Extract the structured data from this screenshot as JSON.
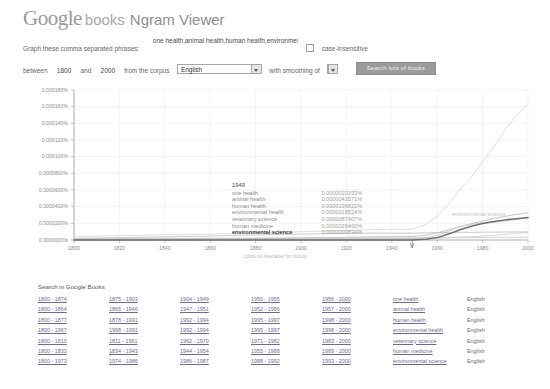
{
  "header": {
    "logo_google": "Google",
    "logo_books": "books",
    "logo_title": "Ngram Viewer"
  },
  "query": {
    "phrases_label": "Graph these comma separated phrases:",
    "phrases_value": "one health,animal health,human health,environmental health,veterina",
    "case_insensitive_label": "case-insensitive",
    "case_insensitive_checked": false,
    "between_label": "between",
    "year_start": "1800",
    "and_label": "and",
    "year_end": "2000",
    "corpus_label": "from the corpus",
    "corpus_value": "English",
    "smoothing_label": "with smoothing of",
    "smoothing_value": "3",
    "search_button": "Search lots of books"
  },
  "chart_data": {
    "type": "line",
    "title": "",
    "xlabel": "",
    "ylabel": "",
    "xlim": [
      1800,
      2000
    ],
    "ylim": [
      0,
      0.00019
    ],
    "grid": true,
    "legend": "on-plot",
    "caption": "(click on line/label for focus)",
    "x_ticks": [
      "1800",
      "1820",
      "1840",
      "1860",
      "1880",
      "1900",
      "1920",
      "1940",
      "1960",
      "1980",
      "2000"
    ],
    "y_ticks": [
      "0.000180%",
      "0.000160%",
      "0.000140%",
      "0.000120%",
      "0.000100%",
      "0.0000800%",
      "0.0000600%",
      "0.0000400%",
      "0.0000200%",
      "0.0000000%"
    ],
    "x": [
      1800,
      1820,
      1840,
      1860,
      1880,
      1900,
      1920,
      1930,
      1940,
      1949,
      1955,
      1960,
      1965,
      1970,
      1975,
      1980,
      1985,
      1990,
      1995,
      2000
    ],
    "series": [
      {
        "name": "one health",
        "color": "#cfcfcf",
        "values": [
          1e-06,
          1.2e-06,
          1.4e-06,
          1.6e-06,
          1.8e-06,
          1.9e-06,
          2e-06,
          2e-06,
          2e-06,
          2e-06,
          2.2e-06,
          2.5e-06,
          3e-06,
          3.6e-06,
          4.2e-06,
          5e-06,
          6e-06,
          7.2e-06,
          8.5e-06,
          9.5e-06
        ]
      },
      {
        "name": "animal health",
        "color": "#b9b9b9",
        "values": [
          8e-07,
          1e-06,
          1.2e-06,
          1.5e-06,
          2e-06,
          2.5e-06,
          3.4e-06,
          4e-06,
          4.3e-06,
          4.4e-06,
          6e-06,
          9e-06,
          1.3e-05,
          1.7e-05,
          2.05e-05,
          2.4e-05,
          2.75e-05,
          3e-05,
          3.25e-05,
          3.45e-05
        ]
      },
      {
        "name": "human health",
        "color": "#d8d8d8",
        "values": [
          4e-06,
          5.5e-06,
          6.5e-06,
          7.5e-06,
          9e-06,
          1.05e-05,
          1.2e-05,
          1.3e-05,
          1.36e-05,
          1.37e-05,
          2e-05,
          3e-05,
          4.5e-05,
          6.4e-05,
          8e-05,
          9.9e-05,
          0.000118,
          0.00014,
          0.000158,
          0.000172
        ]
      },
      {
        "name": "environmental health",
        "color": "#c6c6c6",
        "values": [
          2e-07,
          3e-07,
          4e-07,
          6e-07,
          8e-07,
          1e-06,
          1.4e-06,
          1.6e-06,
          1.8e-06,
          1.9e-06,
          3e-06,
          6e-06,
          1.1e-05,
          1.7e-05,
          2e-05,
          2.15e-05,
          2.25e-05,
          2.4e-05,
          2.6e-05,
          2.8e-05
        ]
      },
      {
        "name": "veterinary science",
        "color": "#bfbfbf",
        "values": [
          2e-06,
          3e-06,
          4e-06,
          5e-06,
          6.5e-06,
          7.5e-06,
          8.5e-06,
          8.7e-06,
          8.7e-06,
          8.7e-06,
          9e-06,
          9.2e-06,
          9.5e-06,
          9.7e-06,
          9.8e-06,
          9.9e-06,
          1e-05,
          1.01e-05,
          1.02e-05,
          1.03e-05
        ]
      },
      {
        "name": "human medicine",
        "color": "#c9c9c9",
        "values": [
          1.5e-06,
          1.8e-06,
          2e-06,
          2.2e-06,
          2.4e-06,
          2.5e-06,
          2.6e-06,
          2.6e-06,
          2.6e-06,
          2.6e-06,
          2.7e-06,
          2.8e-06,
          2.9e-06,
          3e-06,
          3.1e-06,
          3.2e-06,
          3.3e-06,
          3.4e-06,
          3.5e-06,
          3.6e-06
        ]
      },
      {
        "name": "environmental science",
        "color": "#6e6e6e",
        "values": [
          0.0,
          0.0,
          0.0,
          0.0,
          0.0,
          0.0,
          0.0,
          0.0,
          0.0,
          1e-07,
          1e-06,
          3e-06,
          7.5e-06,
          1.3e-05,
          1.75e-05,
          2.1e-05,
          2.35e-05,
          2.55e-05,
          2.7e-05,
          2.85e-05
        ]
      }
    ],
    "on_plot_label": "environmental science"
  },
  "tooltip": {
    "year": "1949",
    "highlight": "environmental science",
    "rows": [
      {
        "label": "one health",
        "value": "0.0000020293%"
      },
      {
        "label": "animal health",
        "value": "0.0000043571%"
      },
      {
        "label": "human health",
        "value": "0.0000136822%"
      },
      {
        "label": "environmental health",
        "value": "0.0000018524%"
      },
      {
        "label": "veterinary science",
        "value": "0.0000087407%"
      },
      {
        "label": "human medicine",
        "value": "0.0000026460%"
      },
      {
        "label": "environmental science",
        "value": "0.0000000834%"
      }
    ]
  },
  "bottom": {
    "title": "Search in Google Books",
    "rows": [
      {
        "cols": [
          "1800 - 1874",
          "1875 - 1903",
          "1904 - 1949",
          "1950 - 1955",
          "1956 - 2000"
        ],
        "phrase": "one health",
        "lang": "English"
      },
      {
        "cols": [
          "1800 - 1864",
          "1865 - 1946",
          "1947 - 1951",
          "1952 - 1956",
          "1957 - 2000"
        ],
        "phrase": "animal health",
        "lang": "English"
      },
      {
        "cols": [
          "1800 - 1877",
          "1878 - 1991",
          "1992 - 1994",
          "1995 - 1997",
          "1998 - 2000"
        ],
        "phrase": "human health",
        "lang": "English"
      },
      {
        "cols": [
          "1800 - 1967",
          "1968 - 1991",
          "1992 - 1994",
          "1995 - 1997",
          "1998 - 2000"
        ],
        "phrase": "environmental health",
        "lang": "English"
      },
      {
        "cols": [
          "1800 - 1810",
          "1811 - 1961",
          "1962 - 1970",
          "1971 - 1982",
          "1983 - 2000"
        ],
        "phrase": "veterinary science",
        "lang": "English"
      },
      {
        "cols": [
          "1800 - 1833",
          "1834 - 1943",
          "1944 - 1954",
          "1955 - 1988",
          "1989 - 2000"
        ],
        "phrase": "human medicine",
        "lang": "English"
      },
      {
        "cols": [
          "1800 - 1973",
          "1974 - 1986",
          "1986 - 1987",
          "1988 - 1992",
          "1993 - 2000"
        ],
        "phrase": "environmental science",
        "lang": "English"
      }
    ]
  }
}
